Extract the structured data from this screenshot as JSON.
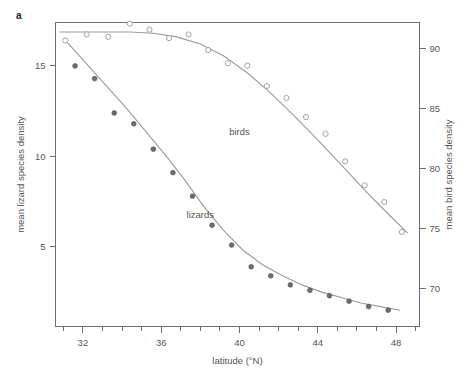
{
  "panel": {
    "label": "a"
  },
  "chart_data": {
    "type": "scatter",
    "title": "",
    "xlabel": "latitude (°N)",
    "ylabel": "mean lizard species density",
    "y2label": "mean bird species density",
    "xlim": [
      30.6,
      49.2
    ],
    "ylim": [
      0.6,
      17.4
    ],
    "y2lim": [
      66.8,
      92.2
    ],
    "xticks": [
      32,
      36,
      40,
      44,
      48
    ],
    "xticklabels": [
      "32",
      "36",
      "40",
      "44",
      "48"
    ],
    "xminorticks": [
      31,
      32,
      33,
      34,
      35,
      36,
      37,
      38,
      39,
      40,
      41,
      42,
      43,
      44,
      45,
      46,
      47,
      48,
      49
    ],
    "yticks": [
      5,
      10,
      15
    ],
    "yticklabels": [
      "5",
      "10",
      "15"
    ],
    "y2ticks": [
      70,
      75,
      80,
      85,
      90
    ],
    "y2ticklabels": [
      "70",
      "75",
      "80",
      "85",
      "90"
    ],
    "grid": false,
    "legend": "inline-annotations",
    "series": [
      {
        "name": "lizards",
        "marker": "filled-circle",
        "color": "#6d6d6d",
        "axis": "left",
        "annotation": "lizards",
        "annotation_x": 38.0,
        "annotation_y": 6.6,
        "x": [
          31.6,
          32.6,
          33.6,
          34.6,
          35.6,
          36.6,
          37.6,
          38.6,
          39.6,
          40.6,
          41.6,
          42.6,
          43.6,
          44.6,
          45.6,
          46.6,
          47.6
        ],
        "y": [
          15.0,
          14.3,
          12.4,
          11.8,
          10.4,
          9.1,
          7.8,
          6.2,
          5.1,
          3.9,
          3.4,
          2.9,
          2.6,
          2.3,
          2.0,
          1.7,
          1.5
        ],
        "fit_x": [
          31.2,
          32.2,
          33.2,
          34.2,
          35.2,
          36.2,
          37.2,
          38.2,
          39.2,
          40.2,
          41.2,
          42.2,
          43.2,
          44.2,
          45.2,
          46.2,
          47.2,
          48.2
        ],
        "fit_y": [
          16.3,
          15.1,
          13.9,
          12.7,
          11.4,
          10.1,
          8.7,
          7.2,
          5.9,
          4.8,
          4.0,
          3.4,
          2.9,
          2.5,
          2.2,
          1.9,
          1.7,
          1.5
        ]
      },
      {
        "name": "birds",
        "marker": "open-circle",
        "color": "#9a9a9a",
        "axis": "right",
        "annotation": "birds",
        "annotation_x": 40.0,
        "annotation_y": 82.8,
        "x": [
          31.1,
          32.2,
          33.3,
          34.4,
          35.4,
          36.4,
          37.4,
          38.4,
          39.4,
          40.4,
          41.4,
          42.4,
          43.4,
          44.4,
          45.4,
          46.4,
          47.4,
          48.3
        ],
        "y": [
          90.7,
          91.2,
          91.0,
          92.1,
          91.6,
          90.9,
          91.2,
          89.9,
          88.8,
          88.6,
          86.9,
          85.9,
          84.3,
          82.9,
          80.6,
          78.6,
          77.2,
          74.7
        ],
        "fit_x": [
          30.8,
          32.0,
          33.2,
          34.4,
          35.6,
          36.8,
          38.0,
          39.2,
          40.4,
          41.6,
          42.8,
          44.0,
          45.2,
          46.4,
          47.6,
          48.6
        ],
        "fit_y": [
          91.4,
          91.4,
          91.4,
          91.4,
          91.3,
          91.0,
          90.4,
          89.4,
          88.0,
          86.3,
          84.4,
          82.4,
          80.3,
          78.2,
          76.2,
          74.6
        ]
      }
    ]
  }
}
